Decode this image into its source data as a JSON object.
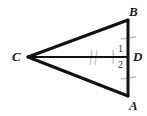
{
  "figure": {
    "kind": "geometry-diagram",
    "stroke_color": "#111111",
    "tick_color": "#b9b9b9",
    "arc_color": "#b0b0b0",
    "background_color": "#ffffff",
    "labels": {
      "B": "B",
      "A": "A",
      "C": "C",
      "D": "D",
      "angle_1": "1",
      "angle_2": "2"
    },
    "points": {
      "B": {
        "x": 128,
        "y": 20
      },
      "A": {
        "x": 128,
        "y": 96
      },
      "C": {
        "x": 28,
        "y": 57
      },
      "D": {
        "x": 128,
        "y": 57
      }
    },
    "segments": [
      {
        "name": "CB",
        "from": "C",
        "to": "B"
      },
      {
        "name": "CA",
        "from": "C",
        "to": "A"
      },
      {
        "name": "BA",
        "from": "B",
        "to": "A"
      },
      {
        "name": "CD",
        "from": "C",
        "to": "D"
      }
    ],
    "tick_marks": [
      {
        "name": "tick-BD",
        "segment": "BD",
        "count": 1
      },
      {
        "name": "tick-DA",
        "segment": "DA",
        "count": 1
      },
      {
        "name": "tick-CD",
        "segment": "CD",
        "count": 2
      }
    ],
    "angle_arcs": [
      {
        "name": "arc-angle-1",
        "at": "D",
        "label": "1"
      },
      {
        "name": "arc-angle-2",
        "at": "D",
        "label": "2"
      }
    ]
  }
}
